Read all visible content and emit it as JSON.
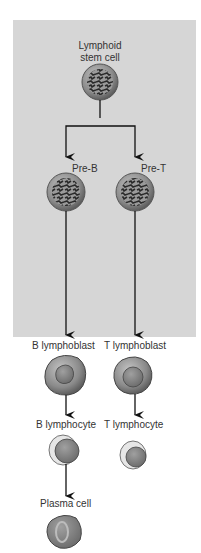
{
  "diagram": {
    "stem_cell": {
      "label_line1": "Lymphoid",
      "label_line2": "stem cell"
    },
    "pre_b": {
      "label": "Pre-B"
    },
    "pre_t": {
      "label": "Pre-T"
    },
    "b_lymphoblast": {
      "label": "B lymphoblast"
    },
    "t_lymphoblast": {
      "label": "T lymphoblast"
    },
    "b_lymphocyte": {
      "label": "B lymphocyte"
    },
    "t_lymphocyte": {
      "label": "T lymphocyte"
    },
    "plasma_cell": {
      "label": "Plasma cell"
    },
    "colors": {
      "panel": "#d6d6d6",
      "cell_outer": "#8c8c8c",
      "cell_nucleus": "#6e6e6e",
      "chromatin": "#2e2e2e",
      "arrow": "#111111"
    }
  }
}
